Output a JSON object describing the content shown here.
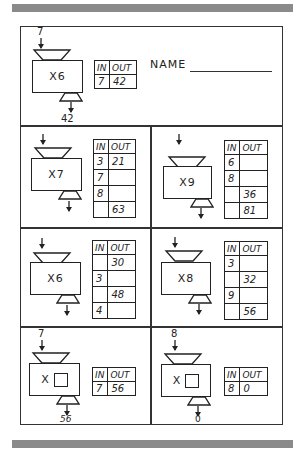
{
  "worksheet": {
    "name_label": "NAME",
    "table_headers": {
      "in": "IN",
      "out": "OUT"
    },
    "example": {
      "operation": "X6",
      "input_value": "7",
      "output_value": "42",
      "rows": [
        {
          "in": "7",
          "out": "42"
        }
      ]
    },
    "problems": [
      {
        "operation": "X7",
        "rows": [
          {
            "in": "3",
            "out": "21"
          },
          {
            "in": "7",
            "out": ""
          },
          {
            "in": "8",
            "out": ""
          },
          {
            "in": "",
            "out": "63"
          }
        ]
      },
      {
        "operation": "X9",
        "rows": [
          {
            "in": "6",
            "out": ""
          },
          {
            "in": "8",
            "out": ""
          },
          {
            "in": "",
            "out": "36"
          },
          {
            "in": "",
            "out": "81"
          }
        ]
      },
      {
        "operation": "X6",
        "rows": [
          {
            "in": "",
            "out": "30"
          },
          {
            "in": "3",
            "out": ""
          },
          {
            "in": "",
            "out": "48"
          },
          {
            "in": "4",
            "out": ""
          }
        ]
      },
      {
        "operation": "X8",
        "rows": [
          {
            "in": "3",
            "out": ""
          },
          {
            "in": "",
            "out": "32"
          },
          {
            "in": "9",
            "out": ""
          },
          {
            "in": "",
            "out": "56"
          }
        ]
      },
      {
        "operation": "X",
        "input_value": "7",
        "output_value": "56",
        "rows": [
          {
            "in": "7",
            "out": "56"
          }
        ]
      },
      {
        "operation": "X",
        "input_value": "8",
        "output_value": "0",
        "rows": [
          {
            "in": "8",
            "out": "0"
          }
        ]
      }
    ]
  }
}
